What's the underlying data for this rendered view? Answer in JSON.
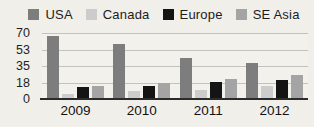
{
  "chart_data": {
    "type": "bar",
    "title": "",
    "xlabel": "",
    "ylabel": "",
    "categories": [
      "2009",
      "2010",
      "2011",
      "2012"
    ],
    "series": [
      {
        "name": "USA",
        "color": "#7d7d7d",
        "values": [
          67,
          58,
          43,
          38
        ]
      },
      {
        "name": "Canada",
        "color": "#cccccc",
        "values": [
          5,
          9,
          10,
          14
        ]
      },
      {
        "name": "Europe",
        "color": "#141414",
        "values": [
          13,
          14,
          18,
          20
        ]
      },
      {
        "name": "SE Asia",
        "color": "#a4a4a4",
        "values": [
          14,
          17,
          21,
          25
        ]
      }
    ],
    "ylim": [
      0,
      70
    ],
    "yticks": [
      70,
      53,
      35,
      18,
      0
    ],
    "grid": true,
    "legend_position": "top"
  },
  "colors": {
    "background": "#f1efea",
    "plot_background": "#f3f1ec",
    "gridline": "#c3c2bf",
    "axis_line": "#2b2b2b",
    "text": "#1f1f1f"
  }
}
